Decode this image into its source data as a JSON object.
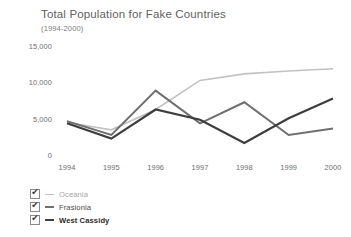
{
  "chart_data": {
    "type": "line",
    "title": "Total Population for Fake Countries",
    "subtitle": "(1994-2000)",
    "xlabel": "",
    "ylabel": "",
    "categories": [
      "1994",
      "1995",
      "1996",
      "1997",
      "1998",
      "1999",
      "2000"
    ],
    "x": [
      1994,
      1995,
      1996,
      1997,
      1998,
      1999,
      2000
    ],
    "ylim": [
      0,
      15000
    ],
    "yticks": [
      0,
      5000,
      10000,
      15000
    ],
    "ytick_labels": [
      "0",
      "5,000",
      "10,000",
      "15,000"
    ],
    "grid": false,
    "legend_position": "bottom-left",
    "series": [
      {
        "name": "Oceania",
        "color": "#c2c2c2",
        "width": 1.6,
        "values": [
          4600,
          3600,
          6400,
          10400,
          11300,
          11700,
          12000
        ]
      },
      {
        "name": "Frasionia",
        "color": "#6f6f6f",
        "width": 2.0,
        "values": [
          4800,
          2900,
          9000,
          4500,
          7400,
          2900,
          3800
        ]
      },
      {
        "name": "West Cassidy",
        "color": "#3d3d3d",
        "width": 2.2,
        "values": [
          4500,
          2400,
          6400,
          5000,
          1800,
          5200,
          7900
        ]
      }
    ]
  },
  "legend": {
    "checkbox_glyph": "✔",
    "items": [
      {
        "label": "Oceania",
        "color": "#c2c2c2",
        "text_color": "#a5a5a5",
        "checked": true
      },
      {
        "label": "Frasionia",
        "color": "#6f6f6f",
        "text_color": "#4a4a4a",
        "checked": true
      },
      {
        "label": "West Cassidy",
        "color": "#3d3d3d",
        "text_color": "#2b2b2b",
        "checked": true
      }
    ]
  }
}
